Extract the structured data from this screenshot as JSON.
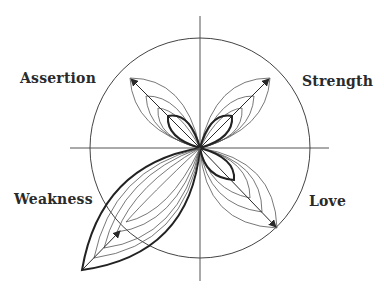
{
  "diagram": {
    "labels": {
      "assertion": "Assertion",
      "strength": "Strength",
      "weakness": "Weakness",
      "love": "Love"
    },
    "colors": {
      "line": "#2a2a2a",
      "thin": "#555555",
      "background": "#ffffff"
    },
    "center": [
      200,
      148
    ],
    "circle_radius": 110,
    "lobes": [
      {
        "name": "Assertion",
        "tip": [
          130,
          78
        ],
        "thick_tip": [
          168,
          116
        ]
      },
      {
        "name": "Strength",
        "tip": [
          270,
          78
        ],
        "thick_tip": [
          232,
          116
        ]
      },
      {
        "name": "Love",
        "tip": [
          277,
          228
        ],
        "thick_tip": [
          234,
          180
        ]
      },
      {
        "name": "Weakness",
        "tip": [
          82,
          270
        ],
        "thick_tip": [
          82,
          270
        ]
      }
    ]
  }
}
